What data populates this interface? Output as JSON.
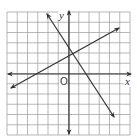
{
  "diagram": {
    "type": "coordinate-plane",
    "grid": {
      "columns": 12,
      "rows": 12,
      "x_min": -6,
      "x_max": 6,
      "y_min": -6,
      "y_max": 6,
      "line_color": "#9a9a9a"
    },
    "axes": {
      "x_label": "x",
      "y_label": "y",
      "origin_label": "O",
      "color": "#333333"
    },
    "lines": [
      {
        "name": "steep-line",
        "from": [
          -2.1,
          5.8
        ],
        "to": [
          4.4,
          -4.2
        ],
        "slope_approx": -1.5
      },
      {
        "name": "shallow-line",
        "from": [
          -5.7,
          -1.3
        ],
        "to": [
          4.9,
          4.5
        ],
        "slope_approx": 0.55
      }
    ],
    "intersection_approx": [
      0.3,
      2
    ]
  }
}
